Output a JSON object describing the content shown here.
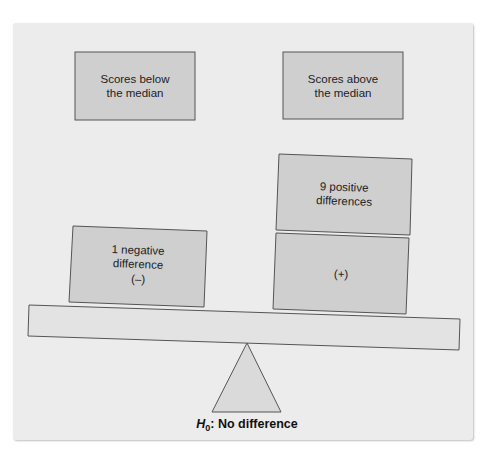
{
  "diagram": {
    "type": "balance-scale",
    "header_boxes": [
      {
        "id": "below",
        "lines": [
          "Scores below",
          "the median"
        ]
      },
      {
        "id": "above",
        "lines": [
          "Scores above",
          "the median"
        ]
      }
    ],
    "left_side": {
      "boxes": [
        {
          "lines": [
            "1 negative",
            "difference",
            "(–)"
          ]
        }
      ],
      "count": 1,
      "sign": "negative"
    },
    "right_side": {
      "boxes": [
        {
          "lines": [
            "9 positive",
            "differences"
          ]
        },
        {
          "lines": [
            "(+)"
          ]
        }
      ],
      "count": 9,
      "sign": "positive"
    },
    "fulcrum_label": {
      "symbol": "H",
      "subscript": "0",
      "text": ": No difference"
    }
  },
  "colors": {
    "panel": "#ececec",
    "box_fill": "#cfcfcf",
    "beam_fill": "#e3e3e3",
    "stroke": "#555555"
  }
}
